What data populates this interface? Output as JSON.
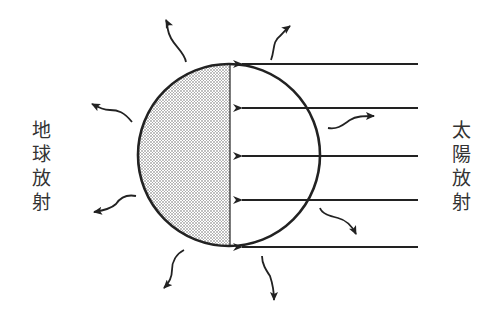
{
  "labels": {
    "earth_radiation": "地球放射",
    "solar_radiation": "太陽放射"
  },
  "colors": {
    "stroke": "#222222",
    "shade": "#bdbdbd",
    "background": "#ffffff"
  },
  "diagram": {
    "globe": {
      "cx": 229,
      "cy": 155,
      "r": 91,
      "shaded_half": "left (night side)"
    },
    "solar_rays": {
      "count": 5,
      "y": [
        64,
        107,
        155,
        200,
        247
      ],
      "x_start": 418,
      "x_end": 230,
      "direction": "right-to-left"
    },
    "outgoing_wavy_arrows": 8
  }
}
